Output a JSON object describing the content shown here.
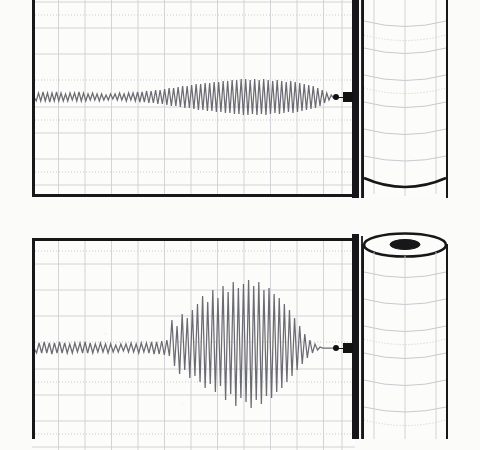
{
  "figure": {
    "kind": "strip-chart-recorder-illustration",
    "caption": "Two strip chart recorder traces with paper supply rolls",
    "background_color": "#fbfbf9",
    "paper_color": "#fcfcfa",
    "ink_color": "#17171a",
    "trace_color": "#6b6b73",
    "grid_color": "#c9c9ce",
    "grid_minor_color": "#d9d9de",
    "panel_count": 2
  },
  "panels": [
    {
      "id": "panel-top",
      "name": "Chart recorder trace, low amplitude",
      "label": "Upper recording",
      "chart_x": 32,
      "chart_y": -16,
      "chart_w": 323,
      "chart_h": 212,
      "grid_cols": 12,
      "grid_rows": 8,
      "grid_spacing_x": 26.5,
      "grid_spacing_y": 26.5,
      "baseline_y": 97,
      "pen_x": 347,
      "pen_y": 97,
      "roll": {
        "x": 362,
        "y": -20,
        "w": 86,
        "h": 218,
        "top_ellipse_visible": false,
        "hub_visible": false,
        "bands": 8
      }
    },
    {
      "id": "panel-bottom",
      "name": "Chart recorder trace, growing amplitude",
      "label": "Lower recording",
      "chart_x": 32,
      "chart_y": 238,
      "chart_w": 323,
      "chart_h": 212,
      "grid_cols": 12,
      "grid_rows": 8,
      "grid_spacing_x": 26.5,
      "grid_spacing_y": 26.5,
      "baseline_y": 348,
      "pen_x": 347,
      "pen_y": 348,
      "roll": {
        "x": 362,
        "y": 232,
        "w": 86,
        "h": 218,
        "top_ellipse_visible": true,
        "hub_visible": true,
        "bands": 8
      }
    }
  ],
  "chart_data": [
    {
      "type": "line",
      "id": "trace-top",
      "title": "Upper strip chart recording",
      "xlabel": "time (chart divisions)",
      "ylabel": "amplitude (chart divisions)",
      "xlim": [
        0,
        323
      ],
      "ylim": [
        -30,
        30
      ],
      "grid": true,
      "legend": "none",
      "annotation": "Oscillation amplitude grows slowly from left to right, then tapers at the pen",
      "baseline": 0,
      "samples": 132,
      "envelope_note": "peak-to-peak grows from about 0.25 division to about 1.6 divisions",
      "series": [
        {
          "name": "recorded signal",
          "color": "#6b6b73",
          "y": [
            0,
            -4,
            4,
            -4,
            5,
            -4,
            4,
            -5,
            4,
            -4,
            5,
            -4,
            4,
            -4,
            3,
            -4,
            4,
            -3,
            4,
            -4,
            5,
            -4,
            4,
            -4,
            3,
            -3,
            4,
            -3,
            3,
            -4,
            3,
            -3,
            2,
            -3,
            3,
            -2,
            3,
            -3,
            4,
            -3,
            3,
            -4,
            4,
            -3,
            4,
            -4,
            5,
            -5,
            5,
            -5,
            6,
            -6,
            6,
            -6,
            7,
            -7,
            7,
            -7,
            8,
            -8,
            9,
            -9,
            9,
            -9,
            10,
            -10,
            11,
            -11,
            11,
            -11,
            12,
            -12,
            13,
            -13,
            13,
            -13,
            14,
            -14,
            14,
            -14,
            15,
            -15,
            15,
            -15,
            16,
            -16,
            16,
            -16,
            17,
            -17,
            17,
            -17,
            18,
            -18,
            18,
            -18,
            17,
            -17,
            18,
            -18,
            17,
            -17,
            18,
            -18,
            17,
            -17,
            16,
            -16,
            17,
            -17,
            16,
            -16,
            15,
            -15,
            16,
            -16,
            15,
            -15,
            14,
            -14,
            13,
            -13,
            12,
            -12,
            11,
            -11,
            9,
            -9,
            7,
            -6,
            4,
            -3,
            2,
            -1,
            0,
            0
          ]
        }
      ]
    },
    {
      "type": "line",
      "id": "trace-bottom",
      "title": "Lower strip chart recording",
      "xlabel": "time (chart divisions)",
      "ylabel": "amplitude (chart divisions)",
      "xlim": [
        0,
        323
      ],
      "ylim": [
        -70,
        70
      ],
      "grid": true,
      "legend": "none",
      "annotation": "Flat low-level noise for the first half, then a rapid build-up into large oscillations before the pen",
      "baseline": 0,
      "samples": 120,
      "envelope_note": "peak-to-peak grows from about 0.3 division to about 4.5 divisions",
      "series": [
        {
          "name": "recorded signal",
          "color": "#6b6b73",
          "y": [
            0,
            -5,
            5,
            -5,
            6,
            -5,
            5,
            -6,
            5,
            -5,
            6,
            -5,
            5,
            -5,
            4,
            -5,
            5,
            -4,
            5,
            -5,
            6,
            -5,
            5,
            -5,
            4,
            -4,
            5,
            -4,
            4,
            -5,
            4,
            -4,
            3,
            -4,
            4,
            -3,
            4,
            -4,
            5,
            -4,
            4,
            -5,
            5,
            -4,
            5,
            -5,
            6,
            -6,
            6,
            -6,
            7,
            -7,
            8,
            -8,
            28,
            -18,
            22,
            -26,
            34,
            -22,
            30,
            -30,
            38,
            -28,
            44,
            -34,
            52,
            -40,
            46,
            -36,
            58,
            -44,
            50,
            -38,
            62,
            -52,
            56,
            -46,
            66,
            -58,
            60,
            -50,
            64,
            -54,
            68,
            -60,
            62,
            -52,
            66,
            -56,
            58,
            -48,
            60,
            -50,
            54,
            -44,
            50,
            -40,
            44,
            -34,
            38,
            -28,
            30,
            -22,
            22,
            -16,
            14,
            -10,
            8,
            -5,
            4,
            -2,
            1,
            0,
            0,
            0,
            0,
            0,
            0,
            0
          ]
        }
      ]
    }
  ],
  "parts": {
    "chart_paper_label": "Chart paper",
    "pen_label": "Recording stylus",
    "carriage_label": "Pen carriage",
    "roll_label": "Paper supply roll",
    "hub_label": "Roll core"
  }
}
